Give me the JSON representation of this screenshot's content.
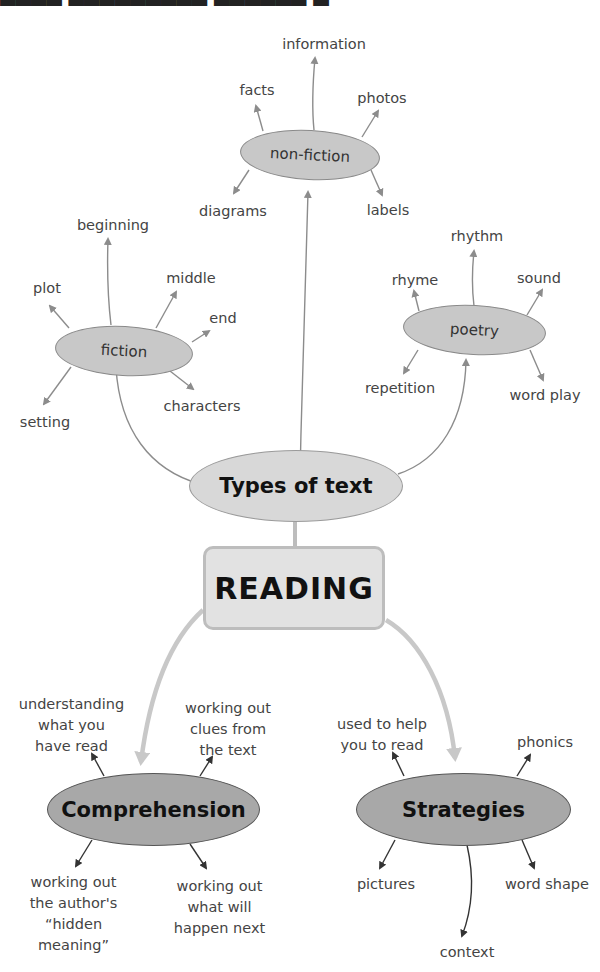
{
  "diagram": {
    "title_fragment": "",
    "center": {
      "label": "READING"
    },
    "colors": {
      "light_node_fill": "#c8c8c8",
      "types_node_fill": "#d8d8d8",
      "dark_node_fill": "#a8a8a8",
      "reading_box_fill": "#e2e2e2",
      "light_arrow": "#8c8c8c",
      "thick_arrow": "#c8c8c8",
      "dark_arrow": "#333333"
    },
    "types_of_text": {
      "label": "Types of text",
      "branches": {
        "non_fiction": {
          "label": "non-fiction",
          "leaves": [
            "information",
            "facts",
            "photos",
            "diagrams",
            "labels"
          ]
        },
        "fiction": {
          "label": "fiction",
          "leaves": [
            "beginning",
            "plot",
            "middle",
            "end",
            "characters",
            "setting"
          ]
        },
        "poetry": {
          "label": "poetry",
          "leaves": [
            "rhythm",
            "rhyme",
            "sound",
            "repetition",
            "word play"
          ]
        }
      }
    },
    "comprehension": {
      "label": "Comprehension",
      "leaves": [
        [
          "understanding",
          "what you",
          "have read"
        ],
        [
          "working out",
          "clues from",
          "the text"
        ],
        [
          "working out",
          "the author's",
          "“hidden",
          "meaning”"
        ],
        [
          "working out",
          "what will",
          "happen next"
        ]
      ]
    },
    "strategies": {
      "label": "Strategies",
      "leaves": [
        [
          "used to help",
          "you to read"
        ],
        [
          "phonics"
        ],
        [
          "pictures"
        ],
        [
          "word shape"
        ],
        [
          "context"
        ]
      ]
    }
  }
}
